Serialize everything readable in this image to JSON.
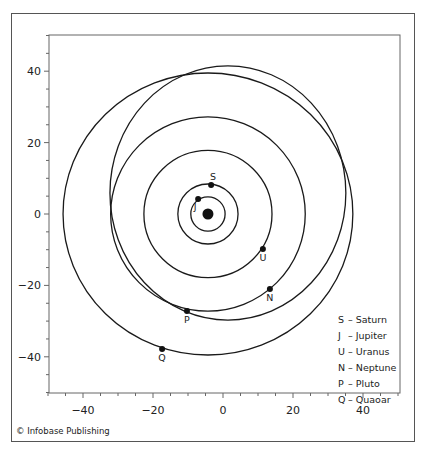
{
  "chart_data": {
    "type": "scatter",
    "title": "",
    "xlabel": "",
    "ylabel": "",
    "xlim": [
      -50,
      50
    ],
    "ylim": [
      -50,
      50
    ],
    "x_ticks": [
      -40,
      -20,
      0,
      20,
      40
    ],
    "y_ticks": [
      40,
      20,
      0,
      -20,
      -40
    ],
    "x_tick_labels": [
      "−40",
      "−20",
      "0",
      "20",
      "40"
    ],
    "y_tick_labels": [
      "40",
      "20",
      "0",
      "−20",
      "−40"
    ],
    "minor_tick_step": 5,
    "grid": false,
    "sun": {
      "x": -4.3,
      "y": 0
    },
    "orbits": [
      {
        "name": "Jupiter",
        "cx": -4.3,
        "cy": 0,
        "rx": 4.9,
        "ry": 4.8
      },
      {
        "name": "Saturn",
        "cx": -4.3,
        "cy": 0,
        "rx": 8.6,
        "ry": 8.4
      },
      {
        "name": "Uranus",
        "cx": -4.3,
        "cy": 0,
        "rx": 18.3,
        "ry": 17.8
      },
      {
        "name": "Neptune",
        "cx": -4.3,
        "cy": 0,
        "rx": 27.8,
        "ry": 27.2
      },
      {
        "name": "Pluto",
        "cx": 1.4,
        "cy": 5.9,
        "rx": 33.7,
        "ry": 35.6
      },
      {
        "name": "Quaoar",
        "cx": -4.3,
        "cy": 0,
        "rx": 41.4,
        "ry": 39.5
      }
    ],
    "planets": [
      {
        "label": "S",
        "name": "Saturn",
        "x": -3.4,
        "y": 8.1
      },
      {
        "label": "J",
        "name": "Jupiter",
        "x": -7.1,
        "y": 4.2
      },
      {
        "label": "U",
        "name": "Uranus",
        "x": 11.4,
        "y": -9.8
      },
      {
        "label": "N",
        "name": "Neptune",
        "x": 13.4,
        "y": -21.0
      },
      {
        "label": "P",
        "name": "Pluto",
        "x": -10.3,
        "y": -27.2
      },
      {
        "label": "Q",
        "name": "Quaoar",
        "x": -17.4,
        "y": -37.8
      }
    ],
    "legend": [
      {
        "key": "S",
        "text": "– Saturn"
      },
      {
        "key": "J",
        "text": "– Jupiter"
      },
      {
        "key": "U",
        "text": "– Uranus"
      },
      {
        "key": "N",
        "text": "– Neptune"
      },
      {
        "key": "P",
        "text": "– Pluto"
      },
      {
        "key": "Q",
        "text": "– Quaoar"
      }
    ],
    "legend_position": "lower right"
  },
  "credit": "© Infobase Publishing"
}
